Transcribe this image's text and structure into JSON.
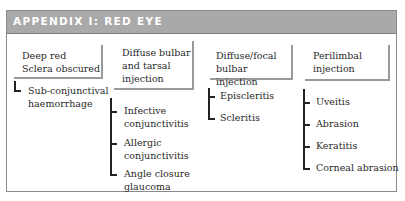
{
  "header": {
    "title": "APPENDIX I: RED EYE"
  },
  "columns": [
    {
      "box_label": "Deep red\nSclera obscured",
      "items": [
        "Sub-conjunctival\nhaemorrhage"
      ]
    },
    {
      "box_label": "Diffuse bulbar\nand tarsal\ninjection",
      "items": [
        "Infective\nconjunctivitis",
        "Allergic\nconjunctivitis",
        "Angle closure\nglaucoma"
      ]
    },
    {
      "box_label": "Diffuse/focal\nbulbar injection",
      "items": [
        "Episcleritis",
        "Scleritis"
      ]
    },
    {
      "box_label": "Perilimbal\ninjection",
      "items": [
        "Uveitis",
        "Abrasion",
        "Keratitis",
        "Corneal abrasion",
        "Corneal\nforeign body"
      ]
    }
  ],
  "colors": {
    "header_bg": "#a9a9a9",
    "header_text": "#ffffff",
    "border": "#8a8a8a"
  }
}
